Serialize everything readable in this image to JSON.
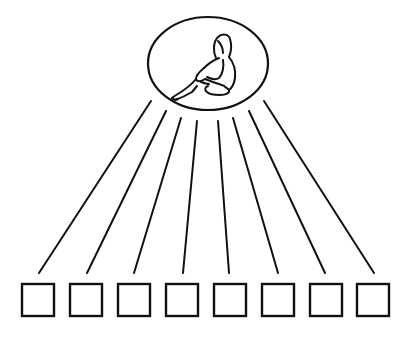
{
  "diagram": {
    "type": "one-to-many",
    "stroke_color": "#111111",
    "background": "#ffffff",
    "root": {
      "shape": "ellipse",
      "content_icon": "seated-person-icon",
      "cx": 208,
      "cy": 63.5,
      "rx": 60,
      "ry": 46.5
    },
    "children_count": 8,
    "children": [
      {
        "shape": "square",
        "x": 22,
        "y": 284,
        "size": 32
      },
      {
        "shape": "square",
        "x": 70,
        "y": 284,
        "size": 32
      },
      {
        "shape": "square",
        "x": 118,
        "y": 284,
        "size": 32
      },
      {
        "shape": "square",
        "x": 166,
        "y": 284,
        "size": 32
      },
      {
        "shape": "square",
        "x": 214,
        "y": 284,
        "size": 32
      },
      {
        "shape": "square",
        "x": 262,
        "y": 284,
        "size": 32
      },
      {
        "shape": "square",
        "x": 310,
        "y": 284,
        "size": 32
      },
      {
        "shape": "square",
        "x": 357,
        "y": 284,
        "size": 32
      }
    ],
    "connectors": [
      {
        "x1": 151,
        "y1": 101,
        "x2": 39,
        "y2": 273
      },
      {
        "x1": 166,
        "y1": 111,
        "x2": 87,
        "y2": 273
      },
      {
        "x1": 181,
        "y1": 118,
        "x2": 134,
        "y2": 273
      },
      {
        "x1": 197,
        "y1": 121,
        "x2": 183,
        "y2": 273
      },
      {
        "x1": 218,
        "y1": 121,
        "x2": 229,
        "y2": 273
      },
      {
        "x1": 233,
        "y1": 118,
        "x2": 278,
        "y2": 273
      },
      {
        "x1": 249,
        "y1": 111,
        "x2": 325,
        "y2": 273
      },
      {
        "x1": 264,
        "y1": 101,
        "x2": 374,
        "y2": 273
      }
    ]
  }
}
